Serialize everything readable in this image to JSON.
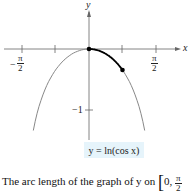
{
  "chart_data": {
    "type": "line",
    "title": "",
    "equation_label": "y = ln(cos x)",
    "xlabel": "x",
    "ylabel": "y",
    "x_ticks": [
      {
        "value": -1.5708,
        "label": "-π/2"
      },
      {
        "value": -0.7854,
        "label": ""
      },
      {
        "value": 0.7854,
        "label": ""
      },
      {
        "value": 1.5708,
        "label": "π/2"
      }
    ],
    "y_ticks": [
      {
        "value": -1,
        "label": "-1"
      }
    ],
    "xlim": [
      -2.0,
      2.1
    ],
    "ylim": [
      -1.5,
      0.8
    ],
    "series": [
      {
        "name": "y = ln(cos x)",
        "x": [
          -1.3,
          -1.0,
          -0.7854,
          -0.5,
          0,
          0.5,
          0.7854,
          1.0,
          1.3
        ],
        "y": [
          -1.319,
          -0.616,
          -0.347,
          -0.131,
          0,
          -0.131,
          -0.347,
          -0.616,
          -1.319
        ],
        "color": "#777777"
      },
      {
        "name": "arc segment [0, π/4]",
        "x": [
          0,
          0.7854
        ],
        "y": [
          0,
          -0.347
        ],
        "color": "#000000",
        "emphasis": true
      }
    ],
    "points": [
      {
        "x": 0,
        "y": 0
      },
      {
        "x": 0.7854,
        "y": -0.3466
      }
    ],
    "grid": false,
    "legend": "none"
  },
  "labels": {
    "y_axis": "y",
    "x_axis": "x",
    "neg_half_pi_sign": "−",
    "pi": "π",
    "two": "2",
    "neg_one": "−1",
    "equation": "y = ln(cos x)",
    "caption_text": "The arc length of the graph of y on ",
    "caption_bracket": "[0, ",
    "caption_pi": "π",
    "caption_two": "2"
  }
}
